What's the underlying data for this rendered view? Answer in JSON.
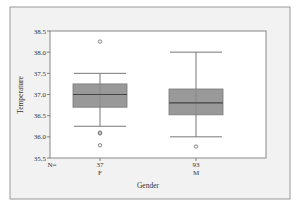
{
  "chart_data": {
    "type": "boxplot",
    "title": "",
    "xlabel": "Gender",
    "ylabel": "Temperature",
    "ylim": [
      35.5,
      38.5
    ],
    "yticks": [
      35.5,
      36.0,
      36.5,
      37.0,
      37.5,
      38.0,
      38.5
    ],
    "ytick_labels": [
      "35.5",
      "36.0",
      "36.5",
      "37.0",
      "37.5",
      "38.0",
      "38.5"
    ],
    "n_label": "N=",
    "categories": [
      "F",
      "M"
    ],
    "groups": [
      {
        "name": "F",
        "n": 37,
        "whisker_low": 36.25,
        "q1": 36.7,
        "median": 37.0,
        "q3": 37.25,
        "whisker_high": 37.5,
        "outliers": [
          38.25,
          36.1,
          36.08,
          35.8
        ]
      },
      {
        "name": "M",
        "n": 93,
        "whisker_low": 36.0,
        "q1": 36.52,
        "median": 36.8,
        "q3": 37.13,
        "whisker_high": 38.0,
        "outliers": [
          35.77
        ]
      }
    ],
    "grid": false,
    "legend": null
  },
  "colors": {
    "frame_bg": "#f2f2f2",
    "plot_bg": "#ffffff",
    "box_fill": "#999999",
    "line": "#777777",
    "median": "#444444"
  }
}
